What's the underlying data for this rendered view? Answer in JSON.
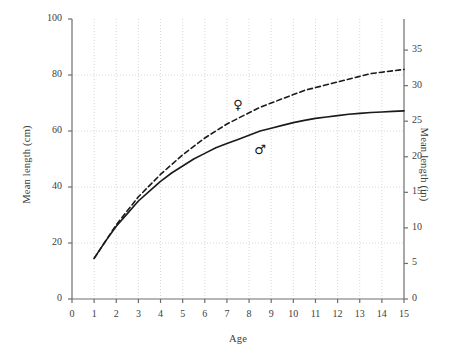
{
  "chart_data": {
    "type": "line",
    "title": "",
    "xlabel": "Age",
    "ylabel": "Mean length (cm)",
    "ylabel_secondary": "Mean length (in)",
    "xlim": [
      0,
      15
    ],
    "ylim": [
      0,
      100
    ],
    "ylim_secondary": [
      0,
      39.37
    ],
    "grid": true,
    "grid_style": "dotted",
    "legend_position": "inline-markers",
    "xticks": [
      0,
      1,
      2,
      3,
      4,
      5,
      6,
      7,
      8,
      9,
      10,
      11,
      12,
      13,
      14,
      15
    ],
    "yticks": [
      0,
      20,
      40,
      60,
      80,
      100
    ],
    "yticks_secondary": [
      0,
      5,
      10,
      15,
      20,
      25,
      30,
      35
    ],
    "x": [
      1,
      1.5,
      2,
      2.5,
      3,
      3.5,
      4,
      4.5,
      5,
      5.5,
      6,
      6.5,
      7,
      7.5,
      8,
      8.5,
      9,
      9.5,
      10,
      10.5,
      11,
      11.5,
      12,
      12.5,
      13,
      13.5,
      14,
      14.5,
      15
    ],
    "series": [
      {
        "name": "Female",
        "symbol": "♀",
        "line_style": "dashed",
        "color": "#1a1a1a",
        "label_position": {
          "x": 7.5,
          "y": 69
        },
        "values": [
          14.5,
          20.5,
          26.5,
          31.5,
          36.5,
          40.5,
          44.5,
          48.0,
          51.5,
          54.5,
          57.5,
          60.0,
          62.5,
          64.5,
          66.5,
          68.5,
          70.0,
          71.5,
          73.0,
          74.5,
          75.5,
          76.5,
          77.5,
          78.5,
          79.5,
          80.5,
          81.0,
          81.5,
          82.0
        ]
      },
      {
        "name": "Male",
        "symbol": "♂",
        "line_style": "solid",
        "color": "#1a1a1a",
        "label_position": {
          "x": 8.5,
          "y": 53
        },
        "values": [
          14.5,
          20.5,
          26.0,
          30.5,
          35.0,
          38.5,
          42.0,
          45.0,
          47.5,
          50.0,
          52.0,
          54.0,
          55.5,
          57.0,
          58.5,
          60.0,
          61.0,
          62.0,
          63.0,
          63.8,
          64.5,
          65.0,
          65.5,
          66.0,
          66.3,
          66.6,
          66.8,
          67.0,
          67.2
        ]
      }
    ]
  },
  "markers": {
    "female_symbol": "♀",
    "male_symbol": "♂"
  }
}
